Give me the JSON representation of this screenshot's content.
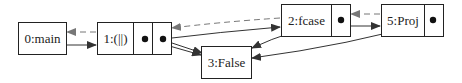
{
  "diagram": {
    "type": "linked-structure-graph",
    "nodes": [
      {
        "id": "0",
        "label": "0:main",
        "fields": 0
      },
      {
        "id": "1",
        "label": "1:(||)",
        "fields": 2
      },
      {
        "id": "2",
        "label": "2:fcase",
        "fields": 1
      },
      {
        "id": "3",
        "label": "3:False",
        "fields": 0
      },
      {
        "id": "5",
        "label": "5:Proj",
        "fields": 1
      }
    ],
    "edges": [
      {
        "from": "0",
        "to": "1",
        "style": "solid"
      },
      {
        "from": "1",
        "to": "0",
        "style": "dashed"
      },
      {
        "from": "1.field0",
        "to": "3",
        "style": "solid"
      },
      {
        "from": "1.field1",
        "to": "3",
        "style": "solid"
      },
      {
        "from": "1.field1",
        "to": "2",
        "style": "solid"
      },
      {
        "from": "2",
        "to": "1",
        "style": "dashed"
      },
      {
        "from": "2.field0",
        "to": "3",
        "style": "solid"
      },
      {
        "from": "2",
        "to": "5",
        "style": "solid"
      },
      {
        "from": "5",
        "to": "2",
        "style": "dashed"
      },
      {
        "from": "5.field0",
        "to": "3",
        "style": "solid"
      }
    ]
  },
  "colors": {
    "stroke": "#222222",
    "dashed": "#777777",
    "background": "#ffffff"
  }
}
